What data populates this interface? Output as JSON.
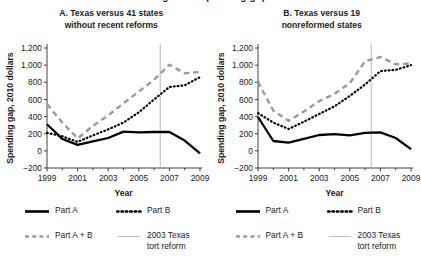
{
  "figure": {
    "clipped_top_text": "Figure 3. Spending gap"
  },
  "panels": [
    {
      "id": "panel-a",
      "title_line1": "A. Texas versus 41 states",
      "title_line2": "without recent reforms",
      "xlabel": "Year",
      "ylabel": "Spending gap, 2010 dollars"
    },
    {
      "id": "panel-b",
      "title_line1": "B. Texas versus 19",
      "title_line2": "nonreformed states",
      "xlabel": "Year",
      "ylabel": "Spending gap, 2010 dollars"
    }
  ],
  "legend": {
    "items": [
      {
        "label": "Part A",
        "style": "solid",
        "color": "#000000"
      },
      {
        "label": "Part B",
        "style": "dotted",
        "color": "#000000"
      },
      {
        "label": "Part A + B",
        "style": "dashed",
        "color": "#9a9a9a"
      },
      {
        "label": "2003 Texas\ntort reform",
        "style": "thin-vertical",
        "color": "#b0b0b0"
      }
    ]
  },
  "chart_data": [
    {
      "type": "line",
      "id": "panel-a",
      "title": "A. Texas versus 41 states without recent reforms",
      "xlabel": "Year",
      "ylabel": "Spending gap, 2010 dollars",
      "x": [
        1999,
        2000,
        2001,
        2002,
        2003,
        2004,
        2005,
        2006,
        2007,
        2008,
        2009
      ],
      "xlim": [
        1999,
        2009
      ],
      "ylim": [
        -200,
        1200
      ],
      "yticks": [
        -200,
        0,
        200,
        400,
        600,
        800,
        1000,
        1200
      ],
      "ytick_labels": [
        "−200",
        "0",
        "200",
        "400",
        "600",
        "800",
        "1,000",
        "1,200"
      ],
      "xticks": [
        1999,
        2001,
        2003,
        2005,
        2007,
        2009
      ],
      "xtick_labels": [
        "1999",
        "2001",
        "2003",
        "2005",
        "2007",
        "2009"
      ],
      "grid": false,
      "legend_position": "below",
      "annotations": [
        {
          "type": "vline",
          "x": 2006.4,
          "label": "2003 Texas tort reform",
          "color": "#b0b0b0"
        }
      ],
      "series": [
        {
          "name": "Part A",
          "style": "solid",
          "color": "#000000",
          "values": [
            310,
            140,
            70,
            110,
            150,
            225,
            215,
            220,
            220,
            120,
            -30
          ]
        },
        {
          "name": "Part B",
          "style": "dotted",
          "color": "#000000",
          "values": [
            210,
            170,
            105,
            180,
            250,
            330,
            450,
            600,
            745,
            765,
            860
          ]
        },
        {
          "name": "Part A + B",
          "style": "dashed",
          "color": "#9a9a9a",
          "values": [
            545,
            330,
            145,
            290,
            415,
            555,
            690,
            830,
            1005,
            905,
            920
          ]
        }
      ]
    },
    {
      "type": "line",
      "id": "panel-b",
      "title": "B. Texas versus 19 nonreformed states",
      "xlabel": "Year",
      "ylabel": "Spending gap, 2010 dollars",
      "x": [
        1999,
        2000,
        2001,
        2002,
        2003,
        2004,
        2005,
        2006,
        2007,
        2008,
        2009
      ],
      "xlim": [
        1999,
        2009
      ],
      "ylim": [
        -200,
        1200
      ],
      "yticks": [
        -200,
        0,
        200,
        400,
        600,
        800,
        1000,
        1200
      ],
      "ytick_labels": [
        "−200",
        "0",
        "200",
        "400",
        "600",
        "800",
        "1,000",
        "1,200"
      ],
      "xticks": [
        1999,
        2001,
        2003,
        2005,
        2007,
        2009
      ],
      "xtick_labels": [
        "1999",
        "2001",
        "2003",
        "2005",
        "2007",
        "2009"
      ],
      "grid": false,
      "legend_position": "below",
      "annotations": [
        {
          "type": "vline",
          "x": 2006.4,
          "label": "2003 Texas tort reform",
          "color": "#b0b0b0"
        }
      ],
      "series": [
        {
          "name": "Part A",
          "style": "solid",
          "color": "#000000",
          "values": [
            395,
            115,
            95,
            140,
            185,
            195,
            180,
            210,
            215,
            150,
            20
          ]
        },
        {
          "name": "Part B",
          "style": "dotted",
          "color": "#000000",
          "values": [
            440,
            330,
            255,
            340,
            430,
            520,
            640,
            775,
            930,
            945,
            1000
          ]
        },
        {
          "name": "Part A + B",
          "style": "dashed",
          "color": "#9a9a9a",
          "values": [
            805,
            470,
            350,
            460,
            580,
            665,
            790,
            1045,
            1095,
            1010,
            1020
          ]
        }
      ]
    }
  ]
}
